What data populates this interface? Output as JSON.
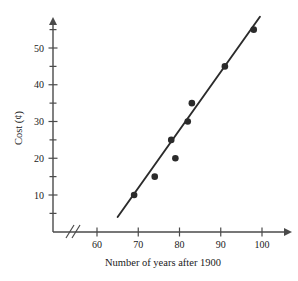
{
  "chart_data": {
    "type": "scatter",
    "title": "",
    "xlabel": "Number of years after 1900",
    "ylabel": "Cost (¢)",
    "xlim": [
      58,
      104
    ],
    "ylim": [
      0,
      59
    ],
    "grid": false,
    "legend": null,
    "axis_break_x": true,
    "x": [
      69,
      74,
      78,
      79,
      82,
      83,
      91,
      98
    ],
    "y": [
      10,
      15,
      25,
      20,
      30,
      35,
      45,
      55
    ],
    "points": [
      {
        "x": 69,
        "y": 10
      },
      {
        "x": 74,
        "y": 15
      },
      {
        "x": 78,
        "y": 25
      },
      {
        "x": 79,
        "y": 20
      },
      {
        "x": 82,
        "y": 30
      },
      {
        "x": 83,
        "y": 35
      },
      {
        "x": 91,
        "y": 45
      },
      {
        "x": 98,
        "y": 55
      }
    ],
    "trend_line": {
      "x0": 65,
      "y0": 4,
      "x1": 99.5,
      "y1": 58.5
    },
    "x_ticks_major": [
      60,
      70,
      80,
      90,
      100
    ],
    "x_tick_labels": [
      "60",
      "70",
      "80",
      "90",
      "100"
    ],
    "y_ticks_major": [
      10,
      20,
      30,
      40,
      50
    ],
    "y_tick_labels": [
      "10",
      "20",
      "30",
      "40",
      "50"
    ],
    "y_ticks_minor": [
      5,
      15,
      25,
      35,
      45,
      55
    ],
    "marker_color": "#2b2b2b",
    "line_color": "#2b2b2b",
    "axis_color": "#4a4a4a",
    "background": "#ffffff"
  }
}
